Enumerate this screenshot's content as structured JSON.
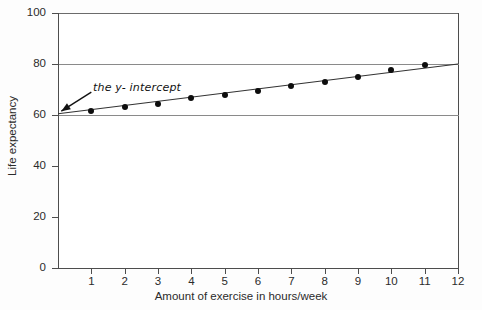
{
  "chart_data": {
    "type": "scatter",
    "title": "",
    "xlabel": "Amount of exercise in hours/week",
    "ylabel": "Life expectancy",
    "xlim": [
      0,
      12
    ],
    "ylim": [
      0,
      100
    ],
    "xticks": [
      "1",
      "2",
      "3",
      "4",
      "5",
      "6",
      "7",
      "8",
      "9",
      "10",
      "11",
      "12"
    ],
    "xtick_values": [
      1,
      2,
      3,
      4,
      5,
      6,
      7,
      8,
      9,
      10,
      11,
      12
    ],
    "yticks": [
      "0",
      "20",
      "40",
      "60",
      "80",
      "100"
    ],
    "ytick_values": [
      0,
      20,
      40,
      60,
      80,
      100
    ],
    "grid": true,
    "gridlines_y": [
      60,
      80
    ],
    "legend": "none",
    "x": [
      1,
      2,
      3,
      4,
      5,
      6,
      7,
      8,
      9,
      10,
      11
    ],
    "values": [
      61.5,
      63.0,
      64.5,
      66.5,
      68.0,
      69.5,
      71.5,
      73.0,
      75.0,
      77.5,
      79.5
    ],
    "series": [
      {
        "name": "Life expectancy vs exercise",
        "x": [
          1,
          2,
          3,
          4,
          5,
          6,
          7,
          8,
          9,
          10,
          11
        ],
        "values": [
          61.5,
          63.0,
          64.5,
          66.5,
          68.0,
          69.5,
          71.5,
          73.0,
          75.0,
          77.5,
          79.5
        ]
      }
    ],
    "trendline": {
      "type": "line",
      "x": [
        0,
        12
      ],
      "values": [
        60.5,
        80.0
      ],
      "intercept": 60.5,
      "slope": 1.625
    },
    "annotations": [
      {
        "text": "the y- intercept",
        "label_x": 1.05,
        "label_y": 70.5,
        "arrow_from_x": 1.0,
        "arrow_from_y": 69.0,
        "arrow_to_x": 0.1,
        "arrow_to_y": 61.5
      }
    ]
  },
  "colors": {
    "axis": "#4d4d4d",
    "grid": "#8a8a8a",
    "marker": "#0d0d0d",
    "line": "#333333",
    "text": "#2b2b2b",
    "background": "#ffffff"
  }
}
